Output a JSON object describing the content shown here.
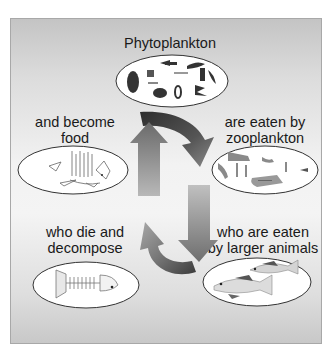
{
  "diagram": {
    "type": "cycle",
    "stages": [
      {
        "id": "phytoplankton",
        "label": "Phytoplankton",
        "illustration": "phytoplankton-cells"
      },
      {
        "id": "zooplankton",
        "label": "are eaten by\nzooplankton",
        "illustration": "zooplankton"
      },
      {
        "id": "larger-animals",
        "label": "who are eaten\nby larger animals",
        "illustration": "two-fish"
      },
      {
        "id": "decompose",
        "label": "who die and\ndecompose",
        "illustration": "fish-skeleton"
      },
      {
        "id": "food",
        "label": "and become\nfood",
        "illustration": "decomposing-fish"
      }
    ],
    "flow": [
      "phytoplankton",
      "zooplankton",
      "larger-animals",
      "decompose",
      "food",
      "phytoplankton"
    ],
    "colors": {
      "panel": "#e4e4e4",
      "ellipse_fill": "#ffffff",
      "ellipse_stroke": "#333333",
      "arrow_dark": "#3a3a3a",
      "arrow_light": "#b0b0b0",
      "text": "#1a1a1a"
    }
  }
}
